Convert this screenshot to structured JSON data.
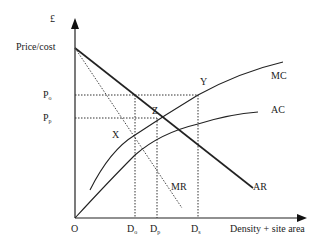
{
  "diagram": {
    "type": "economics-cost-revenue-diagram",
    "y_axis": {
      "unit_label": "£",
      "title": "Price/cost"
    },
    "x_axis": {
      "title": "Density + site area",
      "origin_label": "O"
    },
    "price_labels": [
      {
        "base": "P",
        "sub": "o"
      },
      {
        "base": "P",
        "sub": "p"
      }
    ],
    "quantity_labels": [
      {
        "base": "D",
        "sub": "o"
      },
      {
        "base": "D",
        "sub": "p"
      },
      {
        "base": "D",
        "sub": "s"
      }
    ],
    "curves": [
      {
        "name": "MC",
        "label": "MC",
        "style": "solid"
      },
      {
        "name": "AC",
        "label": "AC",
        "style": "solid"
      },
      {
        "name": "AR",
        "label": "AR",
        "style": "solid-thick"
      },
      {
        "name": "MR",
        "label": "MR",
        "style": "dotted"
      }
    ],
    "points": [
      {
        "label": "X"
      },
      {
        "label": "Y"
      },
      {
        "label": "Z"
      }
    ],
    "colors": {
      "line": "#222222",
      "background": "#ffffff"
    }
  }
}
